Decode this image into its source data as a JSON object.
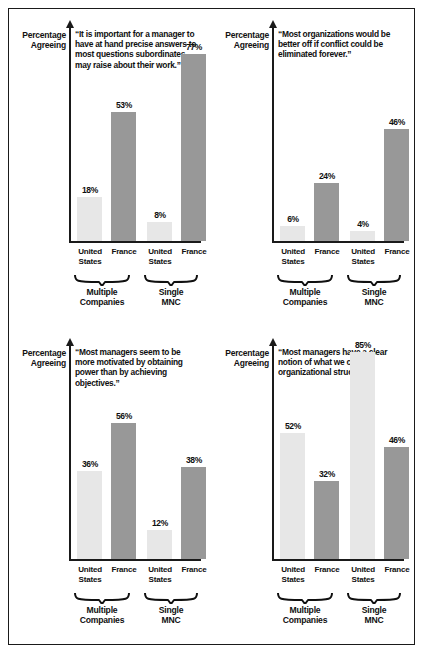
{
  "figure": {
    "y_axis_label_line1": "Percentage",
    "y_axis_label_line2": "Agreeing",
    "category_labels": [
      {
        "line1": "United",
        "line2": "States"
      },
      {
        "line1": "France",
        "line2": ""
      },
      {
        "line1": "United",
        "line2": "States"
      },
      {
        "line1": "France",
        "line2": ""
      }
    ],
    "group_labels": [
      {
        "line1": "Multiple",
        "line2": "Companies"
      },
      {
        "line1": "Single",
        "line2": "MNC"
      }
    ],
    "colors": {
      "united_states_bar": "#e7e7e7",
      "france_bar": "#989898",
      "axis": "#1a1a1a",
      "text": "#101010",
      "frame": "#1a1a1a",
      "background": "#ffffff"
    }
  },
  "chart_data": [
    {
      "type": "bar",
      "panel": "top-left",
      "title": "“It is important for a manager to have at hand precise answers to most questions subordinates may raise about their work.”",
      "xlabel": "",
      "ylabel": "Percentage Agreeing",
      "ylim": [
        0,
        88
      ],
      "grid": false,
      "legend": "none",
      "groups": [
        "Multiple Companies",
        "Single MNC"
      ],
      "categories": [
        "United States",
        "France",
        "United States",
        "France"
      ],
      "values": [
        18,
        53,
        8,
        77
      ],
      "value_labels": [
        "18%",
        "53%",
        "8%",
        "77%"
      ]
    },
    {
      "type": "bar",
      "panel": "top-right",
      "title": "“Most organizations would be better off if conflict could be eliminated forever.”",
      "xlabel": "",
      "ylabel": "Percentage Agreeing",
      "ylim": [
        0,
        88
      ],
      "grid": false,
      "legend": "none",
      "groups": [
        "Multiple Companies",
        "Single MNC"
      ],
      "categories": [
        "United States",
        "France",
        "United States",
        "France"
      ],
      "values": [
        6,
        24,
        4,
        46
      ],
      "value_labels": [
        "6%",
        "24%",
        "4%",
        "46%"
      ]
    },
    {
      "type": "bar",
      "panel": "bottom-left",
      "title": "“Most managers seem to be more motivated by obtaining power than by achieving objectives.”",
      "xlabel": "",
      "ylabel": "Percentage Agreeing",
      "ylim": [
        0,
        88
      ],
      "grid": false,
      "legend": "none",
      "groups": [
        "Multiple Companies",
        "Single MNC"
      ],
      "categories": [
        "United States",
        "France",
        "United States",
        "France"
      ],
      "values": [
        36,
        56,
        12,
        38
      ],
      "value_labels": [
        "36%",
        "56%",
        "12%",
        "38%"
      ]
    },
    {
      "type": "bar",
      "panel": "bottom-right",
      "title": "“Most managers have a clear notion of what we call an organizational structure.”",
      "xlabel": "",
      "ylabel": "Percentage Agreeing",
      "ylim": [
        0,
        88
      ],
      "grid": false,
      "legend": "none",
      "groups": [
        "Multiple Companies",
        "Single MNC"
      ],
      "categories": [
        "United States",
        "France",
        "United States",
        "France"
      ],
      "values": [
        52,
        32,
        85,
        46
      ],
      "value_labels": [
        "52%",
        "32%",
        "85%",
        "46%"
      ]
    }
  ]
}
